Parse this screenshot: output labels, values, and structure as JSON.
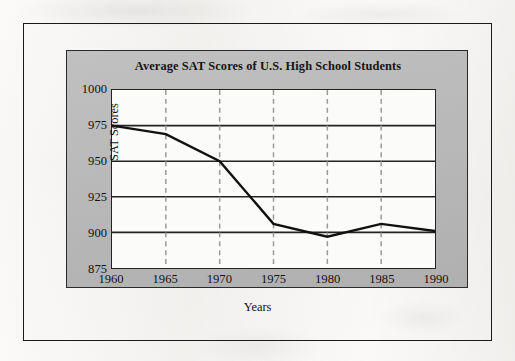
{
  "figure": {
    "background_color": "#f3f1ef",
    "frame_color": "#1a1a1a",
    "panel_color": "#b9b9b9",
    "plot_background": "#fbfbfa",
    "line_color": "#111111",
    "gridline_color": "#232323",
    "dashed_gridline_color": "#9a9a9a"
  },
  "chart_data": {
    "type": "line",
    "title": "Average SAT Scores of U.S. High School Students",
    "xlabel": "Years",
    "ylabel": "SAT Scores",
    "x": [
      1960,
      1965,
      1970,
      1975,
      1980,
      1985,
      1990
    ],
    "categories": [
      "1960",
      "1965",
      "1970",
      "1975",
      "1980",
      "1985",
      "1990"
    ],
    "values": [
      975,
      969,
      950,
      906,
      897,
      906,
      901
    ],
    "series": [
      {
        "name": "Average SAT Score",
        "values": [
          975,
          969,
          950,
          906,
          897,
          906,
          901
        ]
      }
    ],
    "xlim": [
      1960,
      1990
    ],
    "ylim": [
      875,
      1000
    ],
    "xticks": [
      "1960",
      "1965",
      "1970",
      "1975",
      "1980",
      "1985",
      "1990"
    ],
    "yticks": [
      "1000",
      "975",
      "950",
      "925",
      "900",
      "875"
    ],
    "ytick_values": [
      1000,
      975,
      950,
      925,
      900,
      875
    ],
    "grid": {
      "horizontal": "solid",
      "vertical": "dashed",
      "vertical_at": [
        1965,
        1970,
        1975,
        1980,
        1985
      ]
    },
    "legend": null
  }
}
